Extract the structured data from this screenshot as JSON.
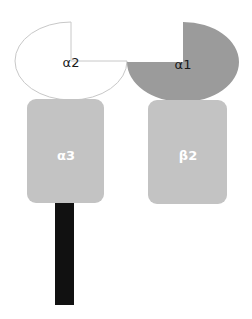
{
  "diagram": {
    "subunits": [
      {
        "id": "alpha2",
        "label": "α2",
        "shape": "pacman-open-top-right",
        "fill": "#ffffff",
        "stroke": "#c8c8c8"
      },
      {
        "id": "alpha1",
        "label": "α1",
        "shape": "pacman-open-top-left",
        "fill": "#9b9b9b"
      },
      {
        "id": "alpha3",
        "label": "α3",
        "shape": "rounded-rect",
        "fill": "#c3c3c3"
      },
      {
        "id": "beta2",
        "label": "β2",
        "shape": "rounded-rect",
        "fill": "#c3c3c3"
      },
      {
        "id": "tm",
        "label": "",
        "shape": "bar",
        "fill": "#111111"
      }
    ]
  }
}
